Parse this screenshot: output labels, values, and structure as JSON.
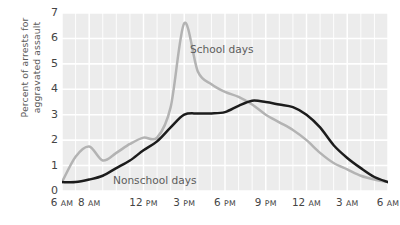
{
  "chart_data": {
    "type": "line",
    "title": "",
    "xlabel": "",
    "ylabel": "Percent of arrests for\naggravated assault",
    "ylim": [
      0,
      7
    ],
    "yticks": [
      0,
      1,
      2,
      3,
      4,
      5,
      6,
      7
    ],
    "xlim": [
      6,
      30
    ],
    "xticks": [
      6,
      8,
      12,
      15,
      18,
      21,
      24,
      27,
      30
    ],
    "xticklabels": [
      "6 AM",
      "8 AM",
      "12 PM",
      "3 PM",
      "6 PM",
      "9 PM",
      "12 AM",
      "3 AM",
      "6 AM"
    ],
    "grid": true,
    "grid_color": "#ffffff",
    "plot_background": "#ececec",
    "legend": "annotations-on-plot",
    "x": [
      6,
      7,
      8,
      9,
      10,
      11,
      12,
      13,
      14,
      15,
      16,
      17,
      18,
      19,
      20,
      21,
      22,
      23,
      24,
      25,
      26,
      27,
      28,
      29,
      30
    ],
    "x_hour_labels": [
      "6 AM",
      "7 AM",
      "8 AM",
      "9 AM",
      "10 AM",
      "11 AM",
      "12 PM",
      "1 PM",
      "2 PM",
      "3 PM",
      "4 PM",
      "5 PM",
      "6 PM",
      "7 PM",
      "8 PM",
      "9 PM",
      "10 PM",
      "11 PM",
      "12 AM",
      "1 AM",
      "2 AM",
      "3 AM",
      "4 AM",
      "5 AM",
      "6 AM"
    ],
    "series": [
      {
        "name": "School days",
        "color": "#b3b3b3",
        "values": [
          0.35,
          1.35,
          1.75,
          1.2,
          1.5,
          1.85,
          2.1,
          2.1,
          3.3,
          6.6,
          4.7,
          4.2,
          3.9,
          3.7,
          3.4,
          3.0,
          2.7,
          2.4,
          2.0,
          1.5,
          1.1,
          0.85,
          0.6,
          0.45,
          0.35
        ],
        "peak": {
          "x_label": "3 PM",
          "value": 6.6
        }
      },
      {
        "name": "Nonschool days",
        "color": "#1c1c1c",
        "values": [
          0.35,
          0.35,
          0.45,
          0.6,
          0.9,
          1.2,
          1.6,
          1.95,
          2.5,
          3.0,
          3.05,
          3.05,
          3.1,
          3.35,
          3.55,
          3.5,
          3.4,
          3.3,
          3.0,
          2.5,
          1.8,
          1.3,
          0.9,
          0.55,
          0.35
        ],
        "peak": {
          "x_label": "8 PM",
          "value": 3.55
        }
      }
    ],
    "annotations": [
      {
        "text": "School days",
        "series": "School days"
      },
      {
        "text": "Nonschool days",
        "series": "Nonschool days"
      }
    ]
  }
}
